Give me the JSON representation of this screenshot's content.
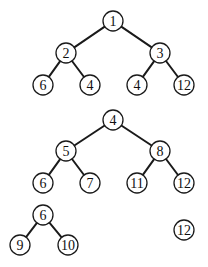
{
  "diagram": {
    "type": "binary-heap-forest",
    "node_radius": 10,
    "colors": {
      "stroke": "#1a1a1a",
      "fill": "#ffffff",
      "text": "#111111"
    },
    "trees": [
      {
        "id": "tree-1",
        "nodes": [
          {
            "id": "t1n1",
            "label": "1",
            "x": 113,
            "y": 21
          },
          {
            "id": "t1n2",
            "label": "2",
            "x": 66,
            "y": 53
          },
          {
            "id": "t1n3",
            "label": "3",
            "x": 160,
            "y": 53
          },
          {
            "id": "t1n4",
            "label": "6",
            "x": 43,
            "y": 85
          },
          {
            "id": "t1n5",
            "label": "4",
            "x": 90,
            "y": 85
          },
          {
            "id": "t1n6",
            "label": "4",
            "x": 137,
            "y": 85
          },
          {
            "id": "t1n7",
            "label": "12",
            "x": 184,
            "y": 85
          }
        ],
        "edges": [
          [
            "t1n1",
            "t1n2"
          ],
          [
            "t1n1",
            "t1n3"
          ],
          [
            "t1n2",
            "t1n4"
          ],
          [
            "t1n2",
            "t1n5"
          ],
          [
            "t1n3",
            "t1n6"
          ],
          [
            "t1n3",
            "t1n7"
          ]
        ]
      },
      {
        "id": "tree-2",
        "nodes": [
          {
            "id": "t2n1",
            "label": "4",
            "x": 113,
            "y": 120
          },
          {
            "id": "t2n2",
            "label": "5",
            "x": 66,
            "y": 151
          },
          {
            "id": "t2n3",
            "label": "8",
            "x": 160,
            "y": 151
          },
          {
            "id": "t2n4",
            "label": "6",
            "x": 43,
            "y": 183
          },
          {
            "id": "t2n5",
            "label": "7",
            "x": 90,
            "y": 183
          },
          {
            "id": "t2n6",
            "label": "11",
            "x": 137,
            "y": 183
          },
          {
            "id": "t2n7",
            "label": "12",
            "x": 184,
            "y": 183
          }
        ],
        "edges": [
          [
            "t2n1",
            "t2n2"
          ],
          [
            "t2n1",
            "t2n3"
          ],
          [
            "t2n2",
            "t2n4"
          ],
          [
            "t2n2",
            "t2n5"
          ],
          [
            "t2n3",
            "t2n6"
          ],
          [
            "t2n3",
            "t2n7"
          ]
        ]
      },
      {
        "id": "tree-3",
        "nodes": [
          {
            "id": "t3n1",
            "label": "6",
            "x": 43,
            "y": 215
          },
          {
            "id": "t3n2",
            "label": "9",
            "x": 20,
            "y": 245
          },
          {
            "id": "t3n3",
            "label": "10",
            "x": 68,
            "y": 245
          }
        ],
        "edges": [
          [
            "t3n1",
            "t3n2"
          ],
          [
            "t3n1",
            "t3n3"
          ]
        ]
      },
      {
        "id": "tree-4",
        "nodes": [
          {
            "id": "t4n1",
            "label": "12",
            "x": 184,
            "y": 230
          }
        ],
        "edges": []
      }
    ]
  }
}
